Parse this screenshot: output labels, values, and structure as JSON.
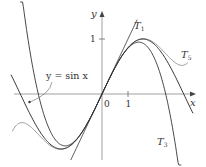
{
  "chart_data": {
    "type": "line",
    "title": "",
    "xlabel": "x",
    "ylabel": "y",
    "x_ticks": [
      {
        "value": 0,
        "label": "0"
      },
      {
        "value": 1,
        "label": "1"
      }
    ],
    "y_ticks": [
      {
        "value": 1,
        "label": "1"
      }
    ],
    "xlim": [
      -3.6,
      3.6
    ],
    "ylim": [
      -1.3,
      1.7
    ],
    "grid": false,
    "series": [
      {
        "name": "y = sin x",
        "expr": "sin(x)",
        "color": "#333333"
      },
      {
        "name": "T1",
        "expr": "x",
        "color": "#333333"
      },
      {
        "name": "T3",
        "expr": "x - x^3/6",
        "color": "#333333"
      },
      {
        "name": "T5",
        "expr": "x - x^3/6 + x^5/120",
        "color": "#999999"
      }
    ],
    "annotations": [
      {
        "text": "y = sin x",
        "arrow_to": "sin curve (left)"
      },
      {
        "text": "T",
        "sub": "1"
      },
      {
        "text": "T",
        "sub": "3"
      },
      {
        "text": "T",
        "sub": "5"
      }
    ]
  },
  "labels": {
    "x_axis": "x",
    "y_axis": "y",
    "origin": "0",
    "x_one": "1",
    "y_one": "1",
    "sin_label": "y = sin x",
    "t": "T",
    "t1_sub": "1",
    "t3_sub": "3",
    "t5_sub": "5"
  }
}
